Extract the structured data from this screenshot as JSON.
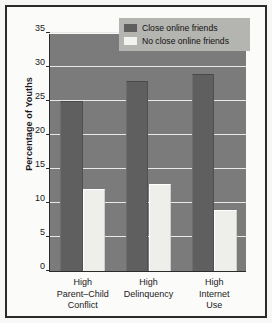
{
  "chart_data": {
    "type": "bar",
    "title": "",
    "xlabel": "",
    "ylabel": "Percentage of Youths",
    "ylim": [
      0,
      35
    ],
    "ytick_step": 5,
    "yticks": [
      0,
      5,
      10,
      15,
      20,
      25,
      30,
      35
    ],
    "ytick_labels": [
      "0",
      "5",
      "10",
      "15",
      "20",
      "25",
      "30",
      "35"
    ],
    "grid": true,
    "grid_axis": "y",
    "legend_position": "top-right-inside",
    "categories": [
      "High\nParent–Child\nConflict",
      "High\nDelinquency",
      "High\nInternet\nUse"
    ],
    "category_lines": [
      [
        "High",
        "Parent–Child",
        "Conflict"
      ],
      [
        "High",
        "Delinquency"
      ],
      [
        "High",
        "Internet",
        "Use"
      ]
    ],
    "series": [
      {
        "name": "Close online friends",
        "color": "#5f5f5f",
        "values": [
          25,
          28,
          29
        ]
      },
      {
        "name": "No close online friends",
        "color": "#eeeeea",
        "values": [
          12,
          12.8,
          9
        ]
      }
    ],
    "plot_background": "#7b7b7b",
    "gridline_color": "#e8e8e4",
    "axis_color": "#2b2b2b",
    "figure_background": "#fbfbfa",
    "frame_color": "#2b2b2b"
  }
}
